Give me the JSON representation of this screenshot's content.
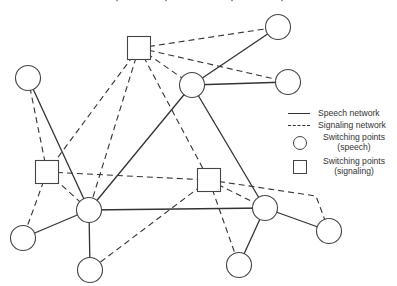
{
  "legend": {
    "items": [
      {
        "symbol": "solid-line",
        "label": "Speech network"
      },
      {
        "symbol": "dashed-line",
        "label": "Signaling network"
      },
      {
        "symbol": "circle",
        "label": "Switching points (speech)"
      },
      {
        "symbol": "square",
        "label": "Switching points (signaling)"
      }
    ]
  },
  "colors": {
    "stroke": "#333333",
    "background": "#ffffff"
  },
  "nodes": {
    "speech": [
      {
        "id": "C1",
        "x": 28,
        "y": 78
      },
      {
        "id": "C2",
        "x": 192,
        "y": 85
      },
      {
        "id": "C3",
        "x": 278,
        "y": 27
      },
      {
        "id": "C4",
        "x": 288,
        "y": 82
      },
      {
        "id": "C5",
        "x": 89,
        "y": 210
      },
      {
        "id": "C6",
        "x": 23,
        "y": 238
      },
      {
        "id": "C7",
        "x": 90,
        "y": 270
      },
      {
        "id": "C8",
        "x": 265,
        "y": 208
      },
      {
        "id": "C9",
        "x": 239,
        "y": 265
      },
      {
        "id": "C10",
        "x": 329,
        "y": 231
      }
    ],
    "signaling": [
      {
        "id": "S1",
        "x": 139,
        "y": 48
      },
      {
        "id": "S2",
        "x": 47,
        "y": 172
      },
      {
        "id": "S3",
        "x": 209,
        "y": 180
      }
    ]
  },
  "edges": {
    "speech": [
      [
        "C1",
        "C5"
      ],
      [
        "C2",
        "C3"
      ],
      [
        "C2",
        "C4"
      ],
      [
        "C2",
        "C5"
      ],
      [
        "C2",
        "C8"
      ],
      [
        "C5",
        "C6"
      ],
      [
        "C5",
        "C7"
      ],
      [
        "C5",
        "C8"
      ],
      [
        "C8",
        "C9"
      ],
      [
        "C8",
        "C10"
      ]
    ],
    "signaling": [
      [
        "S1",
        "C3"
      ],
      [
        "S1",
        "C4"
      ],
      [
        "S1",
        "C2"
      ],
      [
        "S1",
        "S2"
      ],
      [
        "S1",
        "C5"
      ],
      [
        "S1",
        "S3"
      ],
      [
        "C1",
        "S2"
      ],
      [
        "S2",
        "C5"
      ],
      [
        "S2",
        "C6"
      ],
      [
        "S2",
        "S3"
      ],
      [
        "S3",
        "C7"
      ],
      [
        "S3",
        "C9"
      ],
      [
        "S3",
        "C8"
      ],
      [
        "S3",
        "C10"
      ]
    ]
  }
}
